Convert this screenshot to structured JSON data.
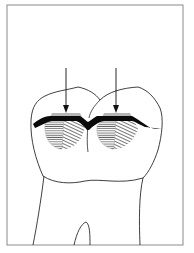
{
  "figure": {
    "frame": {
      "x": 7,
      "y": 5,
      "width": 176,
      "height": 240,
      "stroke": "#8a8a8a"
    },
    "colors": {
      "outline": "#2a2a2a",
      "occlusal_band": "#0a0a0a",
      "hatch": "#555555",
      "facet_gray": "#b5b5b5",
      "background": "#ffffff"
    },
    "arrows": [
      {
        "name": "left-arrow",
        "x": 66,
        "y1": 68,
        "y2": 112
      },
      {
        "name": "right-arrow",
        "x": 116,
        "y1": 68,
        "y2": 112
      }
    ]
  }
}
